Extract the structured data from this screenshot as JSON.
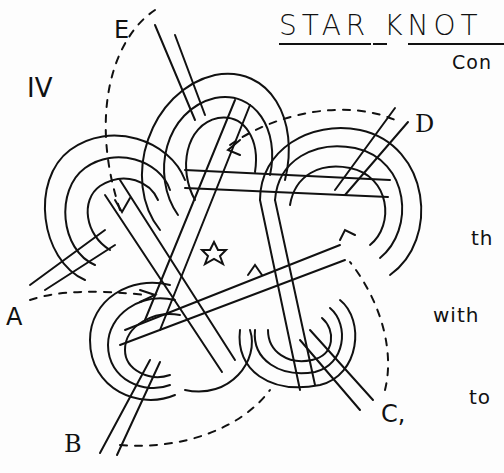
{
  "diagram": {
    "title": "STAR KNOT",
    "subtitle_fragment": "Con",
    "plate_number": "IV",
    "side_text": [
      "th",
      "with",
      "to"
    ],
    "strand_labels": {
      "e": "E",
      "d": "D",
      "a": "A",
      "b": "B",
      "c": "C,"
    },
    "colors": {
      "ink": "#111111",
      "paper": "#fdfdfd"
    }
  }
}
